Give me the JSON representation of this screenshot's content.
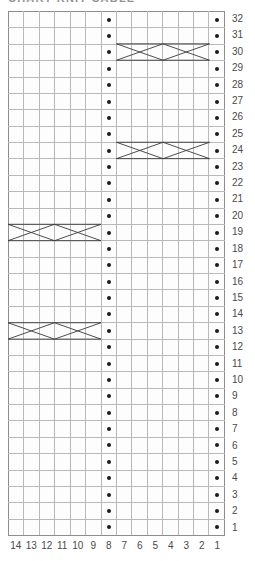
{
  "title": "CHART KNIT CABLE",
  "chart_data": {
    "type": "table",
    "title": "CHART KNIT CABLE",
    "xlabel": "",
    "ylabel": "",
    "grid": true,
    "legend_position": "none",
    "columns": 14,
    "rows": 32,
    "column_labels": [
      14,
      13,
      12,
      11,
      10,
      9,
      8,
      7,
      6,
      5,
      4,
      3,
      2,
      1
    ],
    "row_labels": [
      32,
      31,
      30,
      29,
      28,
      27,
      26,
      25,
      24,
      23,
      22,
      21,
      20,
      19,
      18,
      17,
      16,
      15,
      14,
      13,
      12,
      11,
      10,
      9,
      8,
      7,
      6,
      5,
      4,
      3,
      2,
      1
    ],
    "column_order": "right-to-left",
    "row_order": "bottom-to-top",
    "symbols": {
      "dot": "purl-stitch",
      "blank": "knit-stitch",
      "cross": "cable-cross"
    },
    "purl_columns": [
      8,
      1
    ],
    "cable_rows": [
      {
        "row": 30,
        "columns": [
          7,
          6,
          5,
          4,
          3,
          2
        ],
        "side": "right"
      },
      {
        "row": 24,
        "columns": [
          7,
          6,
          5,
          4,
          3,
          2
        ],
        "side": "right"
      },
      {
        "row": 19,
        "columns": [
          14,
          13,
          12,
          11,
          10,
          9
        ],
        "side": "left"
      },
      {
        "row": 13,
        "columns": [
          14,
          13,
          12,
          11,
          10,
          9
        ],
        "side": "left"
      }
    ],
    "cells": [
      {
        "row": 32,
        "dots": [
          8,
          1
        ],
        "cables": []
      },
      {
        "row": 31,
        "dots": [
          8,
          1
        ],
        "cables": []
      },
      {
        "row": 30,
        "dots": [
          8,
          1
        ],
        "cables": [
          [
            7,
            2
          ]
        ]
      },
      {
        "row": 29,
        "dots": [
          8,
          1
        ],
        "cables": []
      },
      {
        "row": 28,
        "dots": [
          8,
          1
        ],
        "cables": []
      },
      {
        "row": 27,
        "dots": [
          8,
          1
        ],
        "cables": []
      },
      {
        "row": 26,
        "dots": [
          8,
          1
        ],
        "cables": []
      },
      {
        "row": 25,
        "dots": [
          8,
          1
        ],
        "cables": []
      },
      {
        "row": 24,
        "dots": [
          8,
          1
        ],
        "cables": [
          [
            7,
            2
          ]
        ]
      },
      {
        "row": 23,
        "dots": [
          8,
          1
        ],
        "cables": []
      },
      {
        "row": 22,
        "dots": [
          8,
          1
        ],
        "cables": []
      },
      {
        "row": 21,
        "dots": [
          8,
          1
        ],
        "cables": []
      },
      {
        "row": 20,
        "dots": [
          8,
          1
        ],
        "cables": []
      },
      {
        "row": 19,
        "dots": [
          8,
          1
        ],
        "cables": [
          [
            14,
            9
          ]
        ]
      },
      {
        "row": 18,
        "dots": [
          8,
          1
        ],
        "cables": []
      },
      {
        "row": 17,
        "dots": [
          8,
          1
        ],
        "cables": []
      },
      {
        "row": 16,
        "dots": [
          8,
          1
        ],
        "cables": []
      },
      {
        "row": 15,
        "dots": [
          8,
          1
        ],
        "cables": []
      },
      {
        "row": 14,
        "dots": [
          8,
          1
        ],
        "cables": []
      },
      {
        "row": 13,
        "dots": [
          8,
          1
        ],
        "cables": [
          [
            14,
            9
          ]
        ]
      },
      {
        "row": 12,
        "dots": [
          8,
          1
        ],
        "cables": []
      },
      {
        "row": 11,
        "dots": [
          8,
          1
        ],
        "cables": []
      },
      {
        "row": 10,
        "dots": [
          8,
          1
        ],
        "cables": []
      },
      {
        "row": 9,
        "dots": [
          8,
          1
        ],
        "cables": []
      },
      {
        "row": 8,
        "dots": [
          8,
          1
        ],
        "cables": []
      },
      {
        "row": 7,
        "dots": [
          8,
          1
        ],
        "cables": []
      },
      {
        "row": 6,
        "dots": [
          8,
          1
        ],
        "cables": []
      },
      {
        "row": 5,
        "dots": [
          8,
          1
        ],
        "cables": []
      },
      {
        "row": 4,
        "dots": [
          8,
          1
        ],
        "cables": []
      },
      {
        "row": 3,
        "dots": [
          8,
          1
        ],
        "cables": []
      },
      {
        "row": 2,
        "dots": [
          8,
          1
        ],
        "cables": []
      },
      {
        "row": 1,
        "dots": [
          8,
          1
        ],
        "cables": []
      }
    ]
  },
  "colors": {
    "grid_line": "#b9b9b9",
    "grid_border": "#8d8d8d",
    "dot": "#1b1b1b",
    "cable_line": "#3a3a3a",
    "label": "#4a4a4a",
    "background": "#ffffff"
  }
}
